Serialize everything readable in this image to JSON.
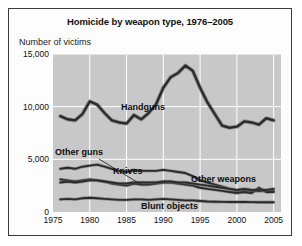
{
  "card": {
    "title": "Homicide by weapon type, 1976–2005",
    "axis_title": "Number of victims"
  },
  "colors": {
    "plot_background": "#c8c8c8",
    "gridline": "#ffffff",
    "series_line": "#2b2b2b",
    "series_halo": "#6e6e6e",
    "border": "#3a3a3a",
    "text": "#111111"
  },
  "chart_data": {
    "type": "line",
    "title": "Homicide by weapon type, 1976–2005",
    "subtitle": "",
    "xlabel": "",
    "ylabel": "Number of victims",
    "xlim": [
      1975,
      2006
    ],
    "ylim": [
      0,
      15000
    ],
    "xticks": [
      "1975",
      "1980",
      "1985",
      "1990",
      "1995",
      "2000",
      "2005"
    ],
    "yticks": [
      "0",
      "5,000",
      "10,000",
      "15,000"
    ],
    "grid": true,
    "legend": "inline-labels",
    "x": [
      1976,
      1977,
      1978,
      1979,
      1980,
      1981,
      1982,
      1983,
      1984,
      1985,
      1986,
      1987,
      1988,
      1989,
      1990,
      1991,
      1992,
      1993,
      1994,
      1995,
      1996,
      1997,
      1998,
      1999,
      2000,
      2001,
      2002,
      2003,
      2004,
      2005
    ],
    "series": [
      {
        "name": "Handguns",
        "label": "Handguns",
        "values": [
          9100,
          8800,
          8700,
          9300,
          10500,
          10200,
          9400,
          8700,
          8500,
          8400,
          9200,
          8800,
          9400,
          10200,
          11800,
          12800,
          13200,
          13900,
          13400,
          11800,
          10400,
          9300,
          8200,
          8000,
          8100,
          8600,
          8500,
          8300,
          8900,
          8700
        ]
      },
      {
        "name": "Knives",
        "label": "Knives",
        "values": [
          4100,
          4200,
          4100,
          4300,
          4400,
          4500,
          4300,
          4100,
          3900,
          3800,
          4000,
          3900,
          3900,
          3900,
          4000,
          3900,
          3800,
          3700,
          3400,
          3000,
          2800,
          2600,
          2400,
          2200,
          2000,
          2100,
          2000,
          2000,
          2000,
          2000
        ]
      },
      {
        "name": "Other guns",
        "label": "Other guns",
        "values": [
          3100,
          3000,
          2900,
          3000,
          3100,
          3000,
          2900,
          2700,
          2600,
          2500,
          2700,
          2600,
          2600,
          2700,
          2800,
          2800,
          2700,
          2600,
          2500,
          2300,
          2200,
          2100,
          2000,
          1900,
          1800,
          1900,
          1800,
          2300,
          1900,
          1900
        ]
      },
      {
        "name": "Other weapons",
        "label": "Other weapons",
        "values": [
          2800,
          2900,
          2800,
          2900,
          3000,
          3000,
          2900,
          2800,
          2700,
          2700,
          2800,
          2800,
          2800,
          2800,
          2900,
          2900,
          2800,
          2800,
          2700,
          2600,
          2500,
          2400,
          2300,
          2200,
          2100,
          2200,
          2100,
          2100,
          2100,
          2200
        ]
      },
      {
        "name": "Blunt objects",
        "label": "Blunt objects",
        "values": [
          1200,
          1250,
          1200,
          1300,
          1350,
          1300,
          1250,
          1200,
          1150,
          1150,
          1200,
          1200,
          1150,
          1200,
          1250,
          1200,
          1150,
          1100,
          1100,
          1050,
          1000,
          980,
          960,
          950,
          950,
          960,
          940,
          930,
          930,
          920
        ]
      }
    ],
    "annotations": [
      {
        "text": "Handguns",
        "for": "Handguns"
      },
      {
        "text": "Other guns",
        "for": "Other guns",
        "leader_line": true
      },
      {
        "text": "Knives",
        "for": "Knives"
      },
      {
        "text": "Other weapons",
        "for": "Other weapons"
      },
      {
        "text": "Blunt objects",
        "for": "Blunt objects"
      }
    ]
  }
}
